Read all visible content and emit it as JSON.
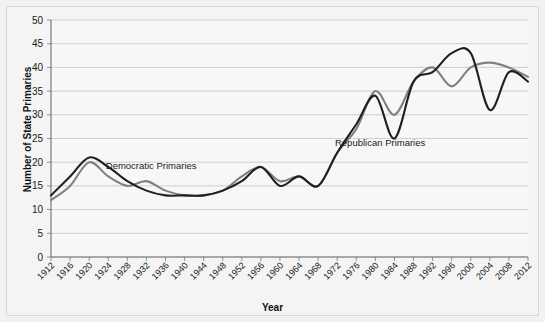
{
  "chart_data": {
    "type": "line",
    "title": "",
    "xlabel": "Year",
    "ylabel": "Number of State Primaries",
    "xlim": [
      1912,
      2012
    ],
    "ylim": [
      0,
      50
    ],
    "grid": "horizontal",
    "legend_position": "inline-annotations",
    "x": [
      1912,
      1916,
      1920,
      1924,
      1928,
      1932,
      1936,
      1940,
      1944,
      1948,
      1952,
      1956,
      1960,
      1964,
      1968,
      1972,
      1976,
      1980,
      1984,
      1988,
      1992,
      1996,
      2000,
      2004,
      2008,
      2012
    ],
    "xticklabels": [
      "1912",
      "1916",
      "1920",
      "1924",
      "1928",
      "1932",
      "1936",
      "1940",
      "1944",
      "1948",
      "1952",
      "1956",
      "1960",
      "1964",
      "1968",
      "1972",
      "1976",
      "1980",
      "1984",
      "1988",
      "1992",
      "1996",
      "2000",
      "2004",
      "2008",
      "2012"
    ],
    "yticklabels": [
      "0",
      "5",
      "10",
      "15",
      "20",
      "25",
      "30",
      "35",
      "40",
      "45",
      "50"
    ],
    "yticks": [
      0,
      5,
      10,
      15,
      20,
      25,
      30,
      35,
      40,
      45,
      50
    ],
    "series": [
      {
        "name": "Democratic Primaries",
        "color": "#808080",
        "label_x": 1933,
        "label_y": 18.5,
        "values": [
          12,
          15,
          20,
          17,
          15,
          16,
          14,
          13,
          13,
          14,
          17,
          19,
          16,
          17,
          15,
          22,
          27,
          35,
          30,
          37,
          40,
          36,
          40,
          41,
          40,
          38
        ]
      },
      {
        "name": "Republican Primaries",
        "color": "#1f1f1f",
        "label_x": 1981,
        "label_y": 23.5,
        "values": [
          13,
          17,
          21,
          19,
          16,
          14,
          13,
          13,
          13,
          14,
          16,
          19,
          15,
          17,
          15,
          22,
          28,
          34,
          25,
          37,
          39,
          43,
          43,
          31,
          39,
          37
        ]
      }
    ],
    "annotations": [
      {
        "text": "Democratic Primaries",
        "x": 1933,
        "y": 18.5
      },
      {
        "text": "Republican Primaries",
        "x": 1981,
        "y": 23.5
      }
    ],
    "colors": {
      "democratic": "#808080",
      "republican": "#1f1f1f",
      "grid": "#bdbdbd",
      "axis": "#6e6e6e",
      "background": "#f2f2f2",
      "plot_background": "#f7f7f7"
    }
  }
}
